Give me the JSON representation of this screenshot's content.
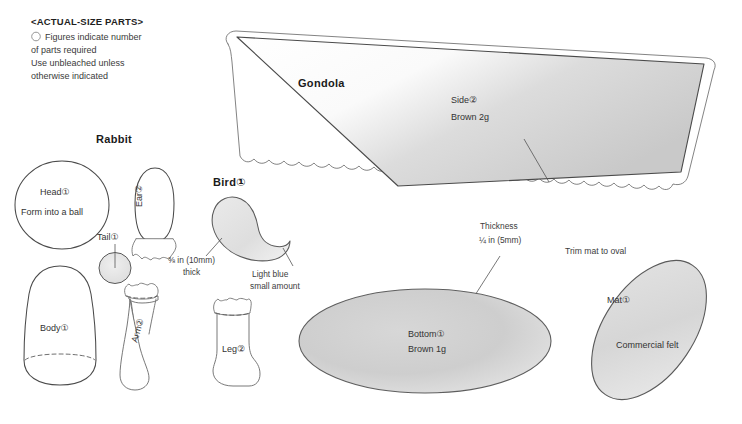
{
  "sheet": {
    "width": 742,
    "height": 424,
    "background": "#ffffff",
    "ink": "#333333"
  },
  "header": {
    "title": "<ACTUAL-SIZE PARTS>",
    "bullet_icon": "circle-outline-icon",
    "legend_lines": [
      "Figures indicate number",
      "of parts required",
      "Use unbleached unless",
      "otherwise indicated"
    ]
  },
  "sections": {
    "rabbit": {
      "title": "Rabbit",
      "parts": [
        {
          "name": "head",
          "label": "Head①",
          "note": "Form into a ball",
          "shape": "circle"
        },
        {
          "name": "ear",
          "label": "Ear②",
          "shape": "rounded-petal-with-tab"
        },
        {
          "name": "tail",
          "label": "Tail①",
          "shape": "small-circle"
        },
        {
          "name": "body",
          "label": "Body①",
          "shape": "bell"
        },
        {
          "name": "arm",
          "label": "Arm②",
          "shape": "sock"
        },
        {
          "name": "leg",
          "label": "Leg②",
          "shape": "boot"
        }
      ]
    },
    "bird": {
      "title": "Bird①",
      "shape": "crescent",
      "notes": [
        {
          "name": "thickness",
          "lines": [
            "⅜ in (10mm)",
            "thick"
          ]
        },
        {
          "name": "material",
          "lines": [
            "Light blue",
            "small amount"
          ]
        }
      ]
    },
    "gondola": {
      "title": "Gondola",
      "parts": [
        {
          "name": "side",
          "label": "Side②",
          "material": "Brown 2g",
          "shape": "scalloped-quad"
        },
        {
          "name": "bottom",
          "label": "Bottom①",
          "material": "Brown 1g",
          "shape": "ellipse"
        }
      ],
      "thickness_note": {
        "lines": [
          "Thickness",
          "¼ in (5mm)"
        ]
      }
    },
    "mat": {
      "trim_note": "Trim mat to oval",
      "label": "Mat①",
      "material": "Commercial felt",
      "shape": "tilted-oval"
    }
  }
}
